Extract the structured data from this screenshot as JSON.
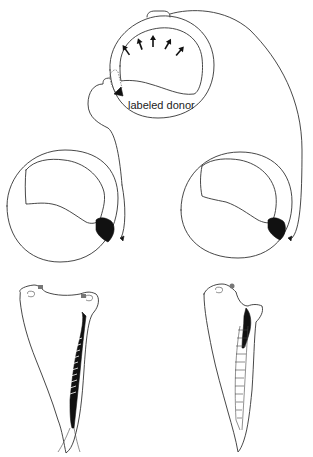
{
  "figure": {
    "type": "schematic diagram"
  },
  "donor": {
    "label": "labeled donor",
    "arrows_count": 5
  },
  "hosts": [
    {
      "position": "left",
      "graft": "black labeled graft region"
    },
    {
      "position": "right",
      "graft": "black labeled graft region"
    }
  ],
  "larvae": [
    {
      "position": "left",
      "labeling": "extensive dark labeling along dorsal structure"
    },
    {
      "position": "right",
      "labeling": "partial dark labeling near anterior"
    }
  ],
  "colors": {
    "line": "#333333",
    "fill_dark": "#111111",
    "background": "#ffffff"
  }
}
